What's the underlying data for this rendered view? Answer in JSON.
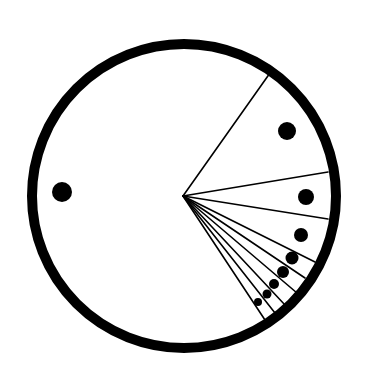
{
  "diagram": {
    "type": "sector-circle",
    "background": "#ffffff",
    "ink": "#000000",
    "circle": {
      "cx": 184,
      "cy": 196,
      "r": 152,
      "stroke_width": 10
    },
    "hub": {
      "x": 183,
      "y": 196
    },
    "radial_lines": [
      {
        "x2": 270,
        "y2": 73
      },
      {
        "x2": 328,
        "y2": 172
      },
      {
        "x2": 328,
        "y2": 219
      },
      {
        "x2": 315,
        "y2": 262
      },
      {
        "x2": 305,
        "y2": 278
      },
      {
        "x2": 297,
        "y2": 293
      },
      {
        "x2": 285,
        "y2": 305
      },
      {
        "x2": 275,
        "y2": 313
      },
      {
        "x2": 265,
        "y2": 320
      }
    ],
    "dots": [
      {
        "cx": 62,
        "cy": 192,
        "r": 10
      },
      {
        "cx": 287,
        "cy": 131,
        "r": 9
      },
      {
        "cx": 306,
        "cy": 197,
        "r": 8
      },
      {
        "cx": 301,
        "cy": 235,
        "r": 7
      },
      {
        "cx": 292,
        "cy": 258,
        "r": 6.5
      },
      {
        "cx": 283,
        "cy": 272,
        "r": 6
      },
      {
        "cx": 274,
        "cy": 284,
        "r": 5
      },
      {
        "cx": 267,
        "cy": 294,
        "r": 4.5
      },
      {
        "cx": 258,
        "cy": 302,
        "r": 4
      }
    ]
  }
}
